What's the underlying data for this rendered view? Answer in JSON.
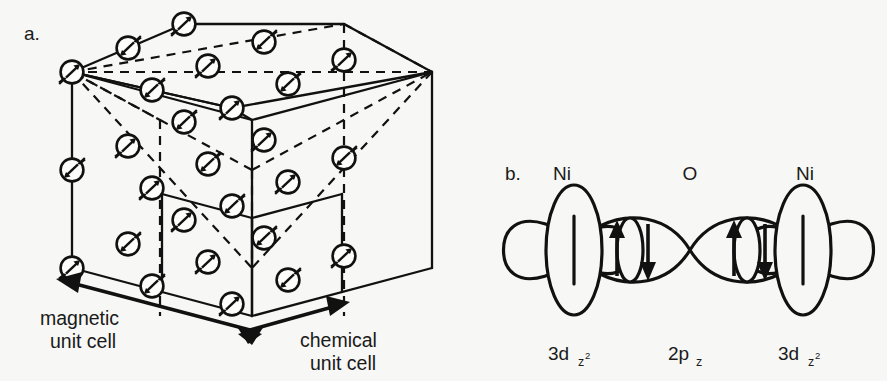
{
  "figure": {
    "background_color": "#f7f7f5",
    "ink_color": "#111111",
    "width": 887,
    "height": 381
  },
  "panel_a": {
    "letter": "a.",
    "caption_left": {
      "line1": "magnetic",
      "line2": "unit cell"
    },
    "caption_right": {
      "line1": "chemical",
      "line2": "unit cell"
    },
    "description": "Isometric cube of the NiO rocksalt lattice with spin arrows on every Ni site; solid outer edges, dashed interior edges.",
    "spin_up_symbol": "up-right-arrow",
    "spin_down_symbol": "down-left-arrow",
    "spin_count": 32,
    "geometry": {
      "origin_x": 72,
      "origin_y": 72,
      "ux": 160,
      "uy": 36,
      "vx": 112,
      "vy": -48,
      "wx": 0,
      "wy": 196,
      "divisions": 2
    },
    "spin_sites": [
      {
        "i": 0,
        "j": 0,
        "k": 0,
        "spin": "up"
      },
      {
        "i": 1,
        "j": 0,
        "k": 0,
        "spin": "down"
      },
      {
        "i": 2,
        "j": 0,
        "k": 0,
        "spin": "up"
      },
      {
        "i": 0,
        "j": 1,
        "k": 0,
        "spin": "down"
      },
      {
        "i": 1,
        "j": 1,
        "k": 0,
        "spin": "up"
      },
      {
        "i": 2,
        "j": 1,
        "k": 0,
        "spin": "down"
      },
      {
        "i": 0,
        "j": 2,
        "k": 0,
        "spin": "up"
      },
      {
        "i": 1,
        "j": 2,
        "k": 0,
        "spin": "down"
      },
      {
        "i": 2,
        "j": 2,
        "k": 0,
        "spin": "up"
      },
      {
        "i": 0,
        "j": 0,
        "k": 1,
        "spin": "down"
      },
      {
        "i": 1,
        "j": 0,
        "k": 1,
        "spin": "up"
      },
      {
        "i": 2,
        "j": 0,
        "k": 1,
        "spin": "down"
      },
      {
        "i": 0,
        "j": 1,
        "k": 1,
        "spin": "up"
      },
      {
        "i": 1,
        "j": 1,
        "k": 1,
        "spin": "down"
      },
      {
        "i": 2,
        "j": 1,
        "k": 1,
        "spin": "up"
      },
      {
        "i": 0,
        "j": 2,
        "k": 1,
        "spin": "down"
      },
      {
        "i": 1,
        "j": 2,
        "k": 1,
        "spin": "up"
      },
      {
        "i": 2,
        "j": 2,
        "k": 1,
        "spin": "down"
      },
      {
        "i": 0,
        "j": 0,
        "k": 2,
        "spin": "up"
      },
      {
        "i": 1,
        "j": 0,
        "k": 2,
        "spin": "down"
      },
      {
        "i": 2,
        "j": 0,
        "k": 2,
        "spin": "up"
      },
      {
        "i": 0,
        "j": 1,
        "k": 2,
        "spin": "down"
      },
      {
        "i": 1,
        "j": 1,
        "k": 2,
        "spin": "up"
      },
      {
        "i": 2,
        "j": 1,
        "k": 2,
        "spin": "down"
      },
      {
        "i": 0,
        "j": 2,
        "k": 2,
        "spin": "up"
      },
      {
        "i": 1,
        "j": 2,
        "k": 2,
        "spin": "down"
      },
      {
        "i": 2,
        "j": 2,
        "k": 2,
        "spin": "up"
      }
    ]
  },
  "panel_b": {
    "letter": "b.",
    "atoms": [
      {
        "label": "Ni",
        "orbital": "3d",
        "orbital_sub": "z",
        "orbital_sub2": "2"
      },
      {
        "label": "O",
        "orbital": "2p",
        "orbital_sub": "z",
        "orbital_sub2": ""
      },
      {
        "label": "Ni",
        "orbital": "3d",
        "orbital_sub": "z",
        "orbital_sub2": "2"
      }
    ],
    "electron_pairs": [
      {
        "left": "up-arrow",
        "right": "down-arrow"
      },
      {
        "left": "up-arrow",
        "right": "down-arrow"
      }
    ],
    "description": "Superexchange pathway: Ni 3d z-squared orbitals overlapping an O 2p z orbital, with paired up/down electron spins."
  }
}
